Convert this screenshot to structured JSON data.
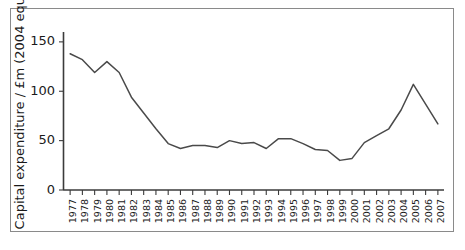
{
  "chart_data": {
    "type": "line",
    "title": "",
    "xlabel": "",
    "ylabel": "Capital expenditure / £m (2004 equiv)",
    "xlim": [
      1977,
      2007
    ],
    "ylim": [
      0,
      160
    ],
    "grid": false,
    "legend": null,
    "line_color": "#4a4a4a",
    "axis_color": "#3b3b3b",
    "y_ticks": [
      0,
      50,
      100,
      150
    ],
    "y_tick_labels": [
      "0",
      "50",
      "100",
      "150"
    ],
    "x_ticks": [
      1977,
      1978,
      1979,
      1980,
      1981,
      1982,
      1983,
      1984,
      1985,
      1986,
      1987,
      1988,
      1989,
      1990,
      1991,
      1992,
      1993,
      1994,
      1995,
      1996,
      1997,
      1998,
      1999,
      2000,
      2001,
      2002,
      2003,
      2004,
      2005,
      2006,
      2007
    ],
    "x_tick_labels": [
      "1977",
      "1978",
      "1979",
      "1980",
      "1981",
      "1982",
      "1983",
      "1984",
      "1985",
      "1986",
      "1987",
      "1988",
      "1989",
      "1990",
      "1991",
      "1992",
      "1993",
      "1994",
      "1995",
      "1996",
      "1997",
      "1998",
      "1999",
      "2000",
      "2001",
      "2002",
      "2003",
      "2004",
      "2005",
      "2006",
      "2007"
    ],
    "categories": [
      1977,
      1978,
      1979,
      1980,
      1981,
      1982,
      1983,
      1984,
      1985,
      1986,
      1987,
      1988,
      1989,
      1990,
      1991,
      1992,
      1993,
      1994,
      1995,
      1996,
      1997,
      1998,
      1999,
      2000,
      2001,
      2002,
      2003,
      2004,
      2005,
      2006,
      2007
    ],
    "values": [
      138,
      132,
      119,
      130,
      119,
      94,
      78,
      62,
      47,
      42,
      45,
      45,
      43,
      50,
      47,
      48,
      42,
      52,
      52,
      47,
      41,
      40,
      30,
      32,
      48,
      55,
      62,
      81,
      107,
      87,
      67
    ],
    "series": [
      {
        "name": "Capital expenditure",
        "values": [
          138,
          132,
          119,
          130,
          119,
          94,
          78,
          62,
          47,
          42,
          45,
          45,
          43,
          50,
          47,
          48,
          42,
          52,
          52,
          47,
          41,
          40,
          30,
          32,
          48,
          55,
          62,
          81,
          107,
          87,
          67
        ]
      }
    ]
  }
}
